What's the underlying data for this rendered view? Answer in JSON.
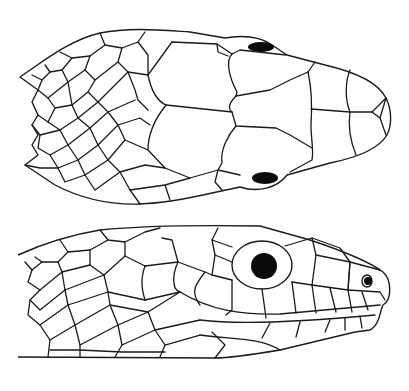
{
  "figure": {
    "views": [
      {
        "id": "dorsal",
        "label": "Dorsal view of snake head"
      },
      {
        "id": "lateral",
        "label": "Lateral view of snake head"
      }
    ],
    "colors": {
      "line": "#1a1a1a",
      "fill": "#ffffff",
      "eye": "#0a0a0a"
    }
  }
}
